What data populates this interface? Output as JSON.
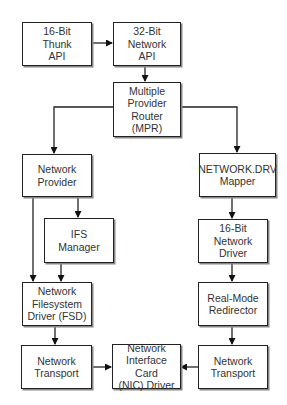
{
  "caption": "Typical network provider component stack",
  "nodes": {
    "thunk": {
      "label": "16-Bit\nThunk\nAPI"
    },
    "netapi32": {
      "label": "32-Bit\nNetwork\nAPI"
    },
    "mpr": {
      "label": "Multiple\nProvider\nRouter\n(MPR)"
    },
    "provider": {
      "label": "Network\nProvider"
    },
    "netdrv": {
      "label": "NETWORK.DRV\nMapper"
    },
    "ifs": {
      "label": "IFS\nManager"
    },
    "driver16": {
      "label": "16-Bit Network\nDriver"
    },
    "fsd": {
      "label": "Network\nFilesystem\nDriver (FSD)"
    },
    "redirector": {
      "label": "Real-Mode\nRedirector"
    },
    "transport_left": {
      "label": "Network\nTransport"
    },
    "nic": {
      "label": "Network\nInterface Card\n(NIC) Driver"
    },
    "transport_right": {
      "label": "Network\nTransport"
    }
  },
  "edges": [
    {
      "from": "thunk",
      "to": "netapi32"
    },
    {
      "from": "netapi32",
      "to": "mpr"
    },
    {
      "from": "mpr",
      "to": "provider"
    },
    {
      "from": "mpr",
      "to": "netdrv"
    },
    {
      "from": "provider",
      "to": "ifs"
    },
    {
      "from": "provider",
      "to": "fsd"
    },
    {
      "from": "ifs",
      "to": "fsd"
    },
    {
      "from": "netdrv",
      "to": "driver16"
    },
    {
      "from": "driver16",
      "to": "redirector"
    },
    {
      "from": "fsd",
      "to": "transport_left"
    },
    {
      "from": "redirector",
      "to": "transport_right"
    },
    {
      "from": "transport_left",
      "to": "nic"
    },
    {
      "from": "transport_right",
      "to": "nic"
    }
  ]
}
